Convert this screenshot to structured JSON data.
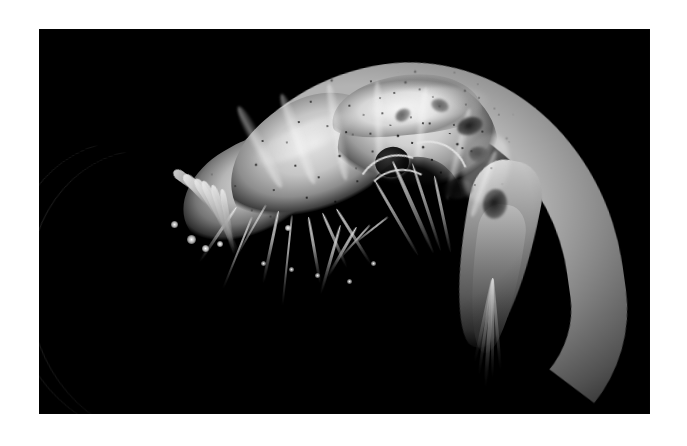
{
  "figure": {
    "domain": "natural-image",
    "caption": "",
    "orientation": "lateral, head to the right, body arched",
    "color_mode": "grayscale",
    "background_color": "#000000",
    "mount_color": "#ffffff",
    "specimen_color": "#b9b9b9",
    "frame": {
      "left": 39,
      "top": 29,
      "width": 611,
      "height": 385
    }
  },
  "anatomy": {
    "parts": [
      {
        "name": "carapace",
        "label": "Carapace"
      },
      {
        "name": "rostrum",
        "label": "Rostrum"
      },
      {
        "name": "eye",
        "label": "Compound eye"
      },
      {
        "name": "antenna",
        "label": "Antennal flagellum"
      },
      {
        "name": "antennular-scale",
        "label": "Antennal scale"
      },
      {
        "name": "maxilliped",
        "label": "Maxilliped"
      },
      {
        "name": "pereiopod",
        "label": "Walking leg"
      },
      {
        "name": "abdomen",
        "label": "Abdomen"
      },
      {
        "name": "pleopod",
        "label": "Pleopod"
      },
      {
        "name": "telson",
        "label": "Telson"
      },
      {
        "name": "uropod",
        "label": "Uropod"
      }
    ]
  }
}
